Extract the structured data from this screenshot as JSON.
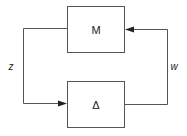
{
  "diagram": {
    "type": "feedback-loop",
    "blocks": [
      {
        "id": "M",
        "label": "M"
      },
      {
        "id": "Delta",
        "label": "Δ"
      }
    ],
    "signals": [
      {
        "id": "z",
        "label": "z",
        "from": "M",
        "to": "Delta"
      },
      {
        "id": "w",
        "label": "w",
        "from": "Delta",
        "to": "M"
      }
    ],
    "colors": {
      "stroke": "#555555",
      "arrow": "#222222",
      "text": "#222222"
    }
  }
}
